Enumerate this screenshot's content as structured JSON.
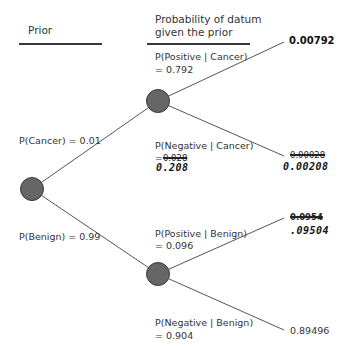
{
  "headers": {
    "prior": "Prior",
    "likelihood_line1": "Probability of datum",
    "likelihood_line2": "given the prior"
  },
  "priors": {
    "cancer": "P(Cancer) = 0.01",
    "benign": "P(Benign) = 0.99"
  },
  "likelihoods": {
    "pos_cancer_l1": "P(Positive | Cancer)",
    "pos_cancer_l2": "= 0.792",
    "neg_cancer_l1": "P(Negative | Cancer)",
    "neg_cancer_eq": "=",
    "neg_cancer_struck": "0.028",
    "neg_cancer_hand": "0.208",
    "pos_benign_l1": "P(Positive | Benign)",
    "pos_benign_l2": "= 0.096",
    "neg_benign_l1": "P(Negative | Benign)",
    "neg_benign_l2": "= 0.904"
  },
  "outcomes": {
    "cancer_positive": "0.00792",
    "cancer_negative_struck": "0.00028",
    "cancer_negative_hand": "0.00208",
    "benign_positive_struck": "0.0954",
    "benign_positive_hand": ".09504",
    "benign_negative": "0.89496"
  },
  "colors": {
    "node_fill": "#666666",
    "node_stroke": "#3a3a3a",
    "line": "#555555"
  }
}
